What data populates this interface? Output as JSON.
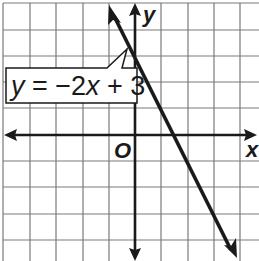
{
  "graph": {
    "equation_label": {
      "y": "y",
      "eq": " = −2",
      "x": "x",
      "rest": " + 3"
    },
    "x_axis_label": "x",
    "y_axis_label": "y",
    "origin_label": "O",
    "line_equation": "y = -2x + 3",
    "slope": -2,
    "y_intercept": 3,
    "x_intercept": 1.5,
    "grid": {
      "x_range": [
        -5,
        4
      ],
      "y_range": [
        -4,
        5
      ],
      "spacing": 1
    },
    "colors": {
      "grid": "#7a7a7a",
      "axes": "#1a1a1a",
      "line": "#1a1a1a",
      "background": "#ffffff"
    }
  }
}
